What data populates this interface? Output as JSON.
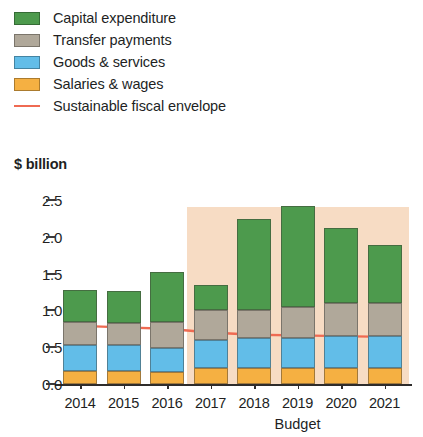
{
  "legend": {
    "items": [
      {
        "label": "Capital expenditure",
        "marker": "swatch",
        "color": "#4d9a4d",
        "name": "capital-expenditure"
      },
      {
        "label": "Transfer payments",
        "marker": "swatch",
        "color": "#b0a89a",
        "name": "transfer-payments"
      },
      {
        "label": "Goods & services",
        "marker": "swatch",
        "color": "#62bde8",
        "name": "goods-and-services"
      },
      {
        "label": "Salaries & wages",
        "marker": "swatch",
        "color": "#f5b042",
        "name": "salaries-and-wages"
      },
      {
        "label": "Sustainable fiscal envelope",
        "marker": "line",
        "color": "#ef6a52",
        "name": "sustainable-fiscal-envelope"
      }
    ]
  },
  "axis": {
    "y_title": "$ billion",
    "x_title": "Budget",
    "y_ticks": [
      "0.0",
      "0.5",
      "1.0",
      "1.5",
      "2.0",
      "2.5"
    ]
  },
  "chart_data": {
    "type": "bar",
    "title": "",
    "subtitle": "",
    "xlabel": "Budget",
    "ylabel": "$ billion",
    "ylim": [
      0.0,
      2.5
    ],
    "ytick_values": [
      0.0,
      0.5,
      1.0,
      1.5,
      2.0,
      2.5
    ],
    "grid": false,
    "legend_position": "top-left",
    "stacked": true,
    "categories": [
      "2014",
      "2015",
      "2016",
      "2017",
      "2018",
      "2019",
      "2020",
      "2021"
    ],
    "series": [
      {
        "name": "Salaries & wages",
        "color": "#f5b042",
        "values": [
          0.18,
          0.18,
          0.16,
          0.22,
          0.22,
          0.22,
          0.22,
          0.22
        ]
      },
      {
        "name": "Goods & services",
        "color": "#62bde8",
        "values": [
          0.35,
          0.35,
          0.33,
          0.38,
          0.41,
          0.41,
          0.43,
          0.43
        ]
      },
      {
        "name": "Transfer payments",
        "color": "#b0a89a",
        "values": [
          0.31,
          0.3,
          0.35,
          0.41,
          0.38,
          0.42,
          0.45,
          0.45
        ]
      },
      {
        "name": "Capital expenditure",
        "color": "#4d9a4d",
        "values": [
          0.44,
          0.44,
          0.68,
          0.34,
          1.23,
          1.37,
          1.02,
          0.79
        ]
      }
    ],
    "totals": [
      1.28,
      1.27,
      1.52,
      1.35,
      2.24,
      2.42,
      2.12,
      1.89
    ],
    "overlay_line": {
      "name": "Sustainable fiscal envelope",
      "color": "#ef6a52",
      "x": [
        "2014",
        "2015",
        "2016",
        "2017",
        "2018",
        "2019",
        "2020",
        "2021"
      ],
      "values": [
        0.79,
        0.77,
        0.75,
        0.7,
        0.67,
        0.66,
        0.65,
        0.64
      ]
    },
    "forecast_shading": {
      "from": "2017",
      "to": "2021",
      "color": "#f7dcc4",
      "top_value": 2.4
    }
  }
}
